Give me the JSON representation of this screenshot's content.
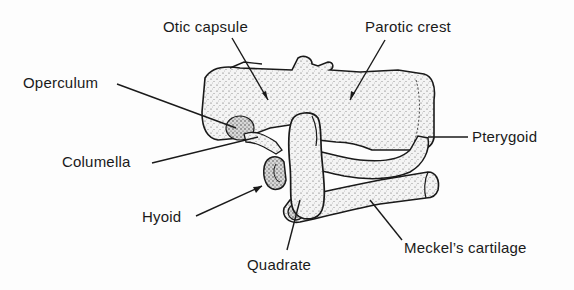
{
  "figure": {
    "colors": {
      "ink": "#1a1a1a",
      "cartilage_fill": "#f1f1f1",
      "background": "#fdfdfd"
    }
  },
  "labels": {
    "otic_capsule": "Otic capsule",
    "parotic_crest": "Parotic crest",
    "operculum": "Operculum",
    "columella": "Columella",
    "pterygoid": "Pterygoid",
    "hyoid": "Hyoid",
    "quadrate": "Quadrate",
    "meckels_cartilage": "Meckel’s cartilage"
  }
}
